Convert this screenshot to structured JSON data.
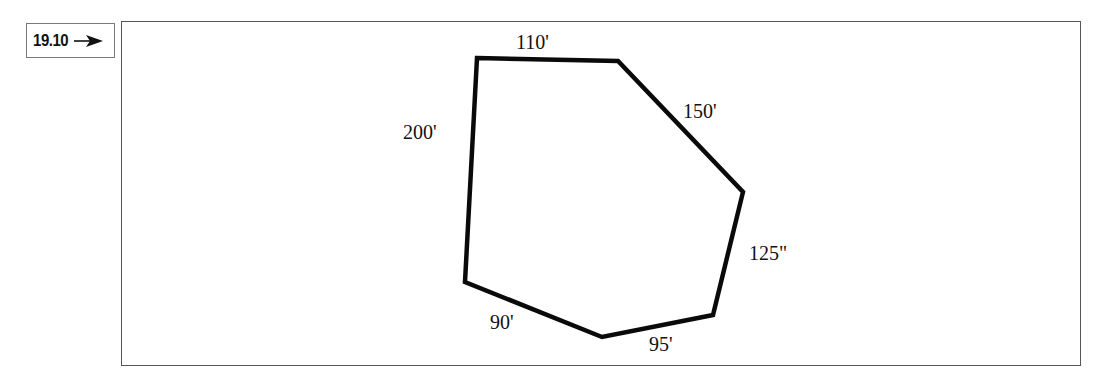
{
  "figure": {
    "number_label": "19.10",
    "pointer_icon": "right-arrow-icon"
  },
  "polygon": {
    "stroke_color": "#0a0a0a",
    "vertices": [
      {
        "x": 477,
        "y": 58
      },
      {
        "x": 618,
        "y": 61
      },
      {
        "x": 743,
        "y": 192
      },
      {
        "x": 713,
        "y": 315
      },
      {
        "x": 602,
        "y": 337
      },
      {
        "x": 465,
        "y": 282
      }
    ],
    "sides": [
      {
        "label": "110'",
        "from": 0,
        "to": 1
      },
      {
        "label": "150'",
        "from": 1,
        "to": 2
      },
      {
        "label": "125\"",
        "from": 2,
        "to": 3
      },
      {
        "label": "95'",
        "from": 3,
        "to": 4
      },
      {
        "label": "90'",
        "from": 4,
        "to": 5
      },
      {
        "label": "200'",
        "from": 5,
        "to": 0
      }
    ]
  }
}
